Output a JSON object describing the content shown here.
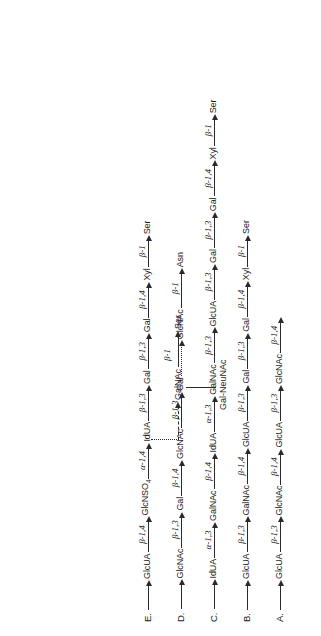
{
  "figure": {
    "orientation": "rotated-90-ccw",
    "rows": [
      {
        "id": "A",
        "label": "A.",
        "sequence": [
          {
            "kind": "arrow",
            "bond": "",
            "style": "plain"
          },
          {
            "kind": "node",
            "text": "GlcUA"
          },
          {
            "kind": "arrow",
            "bond": "β-1,3",
            "style": "solid"
          },
          {
            "kind": "node",
            "text": "GlcNAc"
          },
          {
            "kind": "arrow",
            "bond": "β-1,4",
            "style": "solid"
          },
          {
            "kind": "node",
            "text": "GlcUA"
          },
          {
            "kind": "arrow",
            "bond": "β-1,3",
            "style": "solid"
          },
          {
            "kind": "node",
            "text": "GlcNAc"
          },
          {
            "kind": "arrow",
            "bond": "β-1,4",
            "style": "solid"
          }
        ]
      },
      {
        "id": "B",
        "label": "B.",
        "sequence": [
          {
            "kind": "arrow",
            "bond": "",
            "style": "plain"
          },
          {
            "kind": "node",
            "text": "GlcUA"
          },
          {
            "kind": "arrow",
            "bond": "β-1,3",
            "style": "solid"
          },
          {
            "kind": "node",
            "text": "GalNAc"
          },
          {
            "kind": "arrow",
            "bond": "β-1,4",
            "style": "solid"
          },
          {
            "kind": "node",
            "text": "GlcUA"
          },
          {
            "kind": "arrow",
            "bond": "β-1,3",
            "style": "solid"
          },
          {
            "kind": "node",
            "text": "Gal"
          },
          {
            "kind": "arrow",
            "bond": "β-1,3",
            "style": "solid"
          },
          {
            "kind": "node",
            "text": "Gal"
          },
          {
            "kind": "arrow",
            "bond": "β-1,4",
            "style": "solid"
          },
          {
            "kind": "node",
            "text": "Xyl"
          },
          {
            "kind": "arrow",
            "bond": "β-1",
            "style": "solid"
          },
          {
            "kind": "node",
            "text": "Ser"
          }
        ]
      },
      {
        "id": "C",
        "label": "C.",
        "sequence": [
          {
            "kind": "arrow",
            "bond": "",
            "style": "plain"
          },
          {
            "kind": "node",
            "text": "IdUA"
          },
          {
            "kind": "arrow",
            "bond": "α-1,3",
            "style": "solid"
          },
          {
            "kind": "node",
            "text": "GalNAc"
          },
          {
            "kind": "arrow",
            "bond": "β-1,4",
            "style": "solid"
          },
          {
            "kind": "node",
            "text": "IdUA"
          },
          {
            "kind": "arrow",
            "bond": "α-1,3",
            "style": "solid"
          },
          {
            "kind": "node",
            "text": "GalNAc"
          },
          {
            "kind": "arrow",
            "bond": "β-1,3",
            "style": "solid"
          },
          {
            "kind": "node",
            "text": "GlcUA"
          },
          {
            "kind": "arrow",
            "bond": "β-1,3",
            "style": "solid"
          },
          {
            "kind": "node",
            "text": "Gal"
          },
          {
            "kind": "arrow",
            "bond": "β-1,3",
            "style": "solid"
          },
          {
            "kind": "node",
            "text": "Gal"
          },
          {
            "kind": "arrow",
            "bond": "β-1,4",
            "style": "solid"
          },
          {
            "kind": "node",
            "text": "Xyl"
          },
          {
            "kind": "arrow",
            "bond": "β-1",
            "style": "solid"
          },
          {
            "kind": "node",
            "text": "Ser"
          }
        ]
      },
      {
        "id": "D",
        "label": "D.",
        "sequence": [
          {
            "kind": "arrow",
            "bond": "",
            "style": "plain"
          },
          {
            "kind": "node",
            "text": "GlcNAc"
          },
          {
            "kind": "arrow",
            "bond": "β-1,3",
            "style": "solid"
          },
          {
            "kind": "node",
            "text": "Gal"
          },
          {
            "kind": "arrow",
            "bond": "β-1,4",
            "style": "solid"
          },
          {
            "kind": "node",
            "text": "GlcNAc"
          },
          {
            "kind": "arrow",
            "bond": "β-1,3",
            "style": "solid"
          },
          {
            "kind": "node",
            "text": "Gal"
          },
          {
            "kind": "arrow",
            "bond": "",
            "style": "dotted"
          },
          {
            "kind": "node",
            "text": "GlcNAc"
          },
          {
            "kind": "arrow",
            "bond": "β-1",
            "style": "solid"
          },
          {
            "kind": "node",
            "text": "Asn"
          }
        ]
      },
      {
        "id": "E",
        "label": "E.",
        "sequence": [
          {
            "kind": "arrow",
            "bond": "",
            "style": "plain"
          },
          {
            "kind": "node",
            "text": "GlcUA"
          },
          {
            "kind": "arrow",
            "bond": "β-1,4",
            "style": "solid"
          },
          {
            "kind": "node",
            "text": "GlcNSO4",
            "sub": "4",
            "base": "GlcNSO"
          },
          {
            "kind": "arrow",
            "bond": "α-1,4",
            "style": "solid"
          },
          {
            "kind": "node",
            "text": "IdUA"
          },
          {
            "kind": "arrow",
            "bond": "β-1,3",
            "style": "solid"
          },
          {
            "kind": "node",
            "text": "Gal"
          },
          {
            "kind": "arrow",
            "bond": "β-1,3",
            "style": "solid"
          },
          {
            "kind": "node",
            "text": "Gal"
          },
          {
            "kind": "arrow",
            "bond": "β-1,4",
            "style": "solid"
          },
          {
            "kind": "node",
            "text": "Xyl"
          },
          {
            "kind": "arrow",
            "bond": "β-1",
            "style": "solid"
          },
          {
            "kind": "node",
            "text": "Ser"
          }
        ]
      }
    ],
    "branch": {
      "from_node": "Gal",
      "to_node": "GalNAc",
      "branch_bond": "β-1",
      "branch_terminal": "Ser",
      "side_node": "Gal-NeuNAc",
      "nodes": {
        "galnac": "GalNAc",
        "ser": "Ser",
        "gal_neunac": "Gal-NeuNAc",
        "bond": "β-1"
      }
    }
  }
}
